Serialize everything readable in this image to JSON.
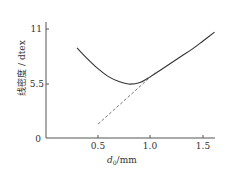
{
  "chart_data": {
    "type": "line",
    "title": "",
    "xlabel": "d0/mm",
    "xlabel_main": "d",
    "xlabel_sub": "0",
    "xlabel_unit": "/mm",
    "ylabel": "线密度 / dtex",
    "xlim": [
      0.3,
      1.65
    ],
    "ylim": [
      0,
      11.5
    ],
    "grid": false,
    "legend": null,
    "x_ticks": [
      "0.5",
      "1.0",
      "1.5"
    ],
    "y_ticks": [
      "0",
      "5.5",
      "11"
    ],
    "series": [
      {
        "name": "curve",
        "style": "solid",
        "x": [
          0.3,
          0.4,
          0.5,
          0.6,
          0.7,
          0.79,
          0.9,
          1.0,
          1.1,
          1.2,
          1.3,
          1.4,
          1.5,
          1.61
        ],
        "values": [
          9.1,
          8.0,
          7.0,
          6.2,
          5.7,
          5.45,
          5.6,
          6.2,
          6.9,
          7.6,
          8.3,
          9.0,
          9.8,
          10.7
        ]
      },
      {
        "name": "tangent line",
        "style": "dashed",
        "x": [
          0.5,
          1.04
        ],
        "values": [
          1.4,
          6.55
        ]
      }
    ]
  }
}
